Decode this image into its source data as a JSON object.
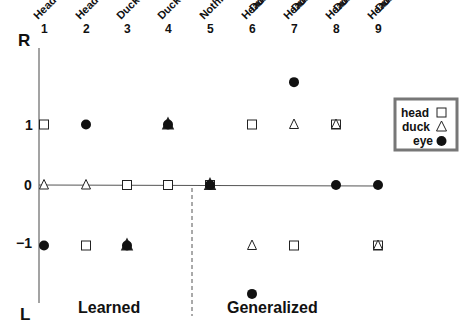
{
  "chart_data": {
    "type": "scatter",
    "title": "",
    "xlabel": "",
    "ylabel": "",
    "y_axis": {
      "top_label": "R",
      "bottom_label": "L",
      "ticks": [
        {
          "value": 1,
          "label": "1"
        },
        {
          "value": 0,
          "label": "0"
        },
        {
          "value": -1,
          "label": "−1"
        }
      ],
      "ylim": [
        -2,
        2
      ]
    },
    "categories": [
      {
        "num": "1",
        "lines": [
          "Head R"
        ]
      },
      {
        "num": "2",
        "lines": [
          "Head L"
        ]
      },
      {
        "num": "3",
        "lines": [
          "Duck L"
        ]
      },
      {
        "num": "4",
        "lines": [
          "Duck R"
        ]
      },
      {
        "num": "5",
        "lines": [
          "Nothing"
        ]
      },
      {
        "num": "6",
        "lines": [
          "Duck L",
          "Head R"
        ]
      },
      {
        "num": "7",
        "lines": [
          "Duck R",
          "Head L"
        ]
      },
      {
        "num": "8",
        "lines": [
          "Duck R",
          "Head R"
        ]
      },
      {
        "num": "9",
        "lines": [
          "Duck L",
          "Head L"
        ]
      }
    ],
    "series": [
      {
        "name": "head",
        "marker": "square",
        "values": [
          1,
          -1,
          0,
          0,
          0,
          1,
          -1,
          1,
          -1
        ]
      },
      {
        "name": "duck",
        "marker": "triangle",
        "values": [
          0,
          0,
          -1,
          1,
          0,
          -1,
          1,
          1,
          -1
        ]
      },
      {
        "name": "eye",
        "marker": "filled-circle",
        "values": [
          -1,
          1,
          -1,
          1,
          0,
          -1.8,
          1.7,
          0,
          0
        ]
      }
    ],
    "regions": [
      {
        "label": "Learned",
        "columns": [
          1,
          2,
          3,
          4
        ]
      },
      {
        "label": "Generalized",
        "columns": [
          5,
          6,
          7,
          8,
          9
        ]
      }
    ],
    "divider_between_columns": [
      4.5,
      5
    ],
    "zero_line": true,
    "grid": false,
    "legend": {
      "position": "right",
      "entries": [
        {
          "label": "head",
          "marker": "square"
        },
        {
          "label": "duck",
          "marker": "triangle"
        },
        {
          "label": "eye",
          "marker": "filled-circle"
        }
      ]
    }
  },
  "labels": {
    "r": "R",
    "l": "L",
    "learned": "Learned",
    "generalized": "Generalized",
    "legend_head": "head",
    "legend_duck": "duck",
    "legend_eye": "eye"
  }
}
